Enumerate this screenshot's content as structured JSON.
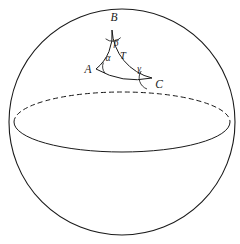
{
  "figure": {
    "background_color": "#ffffff",
    "stroke_color": "#1a1a1a",
    "sphere": {
      "name": "sphere-outline",
      "center_x": 122,
      "center_y": 122,
      "radius": 113,
      "stroke_width": 1.1,
      "fill": "#ffffff"
    },
    "equator": {
      "name": "equator-ellipse",
      "center_x": 122,
      "center_y": 122,
      "radius_x": 108,
      "radius_y": 30,
      "front_style": "solid",
      "back_style": "dashed",
      "dash_pattern": "5,3",
      "stroke_width": 1.0
    },
    "triangle": {
      "name": "spherical-triangle",
      "region_label": "T",
      "stroke_width": 1.0,
      "vertices": [
        {
          "id": "A",
          "label": "A",
          "x": 96,
          "y": 69,
          "label_x": 88,
          "label_y": 70
        },
        {
          "id": "B",
          "label": "B",
          "x": 112,
          "y": 30,
          "label_x": 114,
          "label_y": 18
        },
        {
          "id": "C",
          "label": "C",
          "x": 152,
          "y": 78,
          "label_x": 159,
          "label_y": 85
        }
      ],
      "angles": [
        {
          "id": "alpha",
          "label": "α",
          "at_vertex": "A",
          "label_x": 108,
          "label_y": 59
        },
        {
          "id": "beta",
          "label": "β",
          "at_vertex": "B",
          "label_x": 116,
          "label_y": 44
        },
        {
          "id": "gamma",
          "label": "γ",
          "at_vertex": "C",
          "label_x": 139,
          "label_y": 70
        }
      ],
      "interior": {
        "label": "T",
        "x": 123,
        "y": 57
      }
    }
  }
}
